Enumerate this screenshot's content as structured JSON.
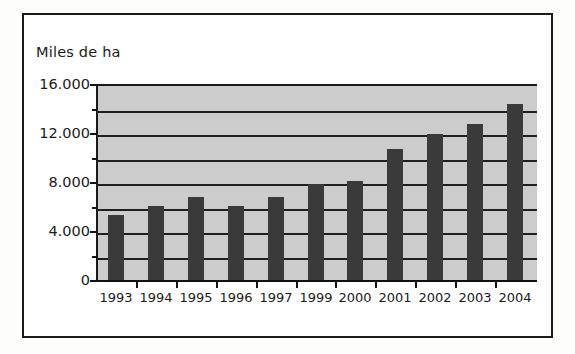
{
  "chart_data": {
    "type": "bar",
    "title": "Miles de ha",
    "xlabel": "",
    "ylabel": "Miles de ha",
    "categories": [
      "1993",
      "1994",
      "1995",
      "1996",
      "1997",
      "1999",
      "2000",
      "2001",
      "2002",
      "2003",
      "2004"
    ],
    "values": [
      5300,
      6000,
      6800,
      6000,
      6800,
      7800,
      8100,
      10700,
      11900,
      12700,
      14400
    ],
    "ylim": [
      0,
      16000
    ],
    "ytick_labels": [
      "0",
      "4.000",
      "8.000",
      "12.000",
      "16.000"
    ],
    "ytick_values": [
      0,
      4000,
      8000,
      12000,
      16000
    ],
    "gridline_values": [
      2000,
      4000,
      6000,
      8000,
      10000,
      12000,
      14000,
      16000
    ],
    "grid": true,
    "legend": "none",
    "colors": {
      "bar": "#3a3a3a",
      "plot_background": "#cccccc",
      "gridline": "#1f1f1f",
      "axis": "#111111",
      "text": "#1b1b1b",
      "frame": "#1a1a1a",
      "page_background": "#ffffff"
    }
  }
}
